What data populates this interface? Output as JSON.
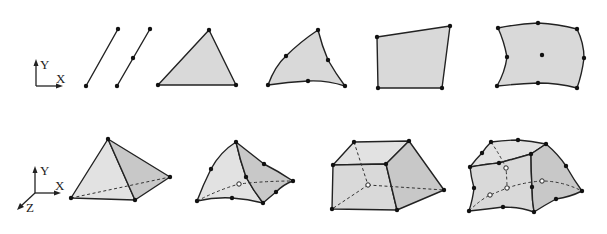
{
  "figure": {
    "row_2d": {
      "axes": {
        "y_label": "Y",
        "x_label": "X"
      },
      "elements": [
        {
          "id": "line-linear",
          "name": "2-node line",
          "nodes": 2
        },
        {
          "id": "line-quadratic",
          "name": "3-node line",
          "nodes": 3
        },
        {
          "id": "tri-linear",
          "name": "3-node triangle",
          "nodes": 3
        },
        {
          "id": "tri-quadratic",
          "name": "6-node triangle",
          "nodes": 6
        },
        {
          "id": "quad-linear",
          "name": "4-node quadrilateral",
          "nodes": 4
        },
        {
          "id": "quad-quadratic",
          "name": "9-node quadrilateral",
          "nodes": 9
        }
      ]
    },
    "row_3d": {
      "axes": {
        "y_label": "Y",
        "x_label": "X",
        "z_label": "Z"
      },
      "elements": [
        {
          "id": "tet-linear",
          "name": "4-node tetrahedron",
          "nodes": 4
        },
        {
          "id": "tet-quadratic",
          "name": "10-node tetrahedron",
          "nodes": 10
        },
        {
          "id": "hex-linear",
          "name": "8-node hexahedron",
          "nodes": 8
        },
        {
          "id": "hex-quadratic",
          "name": "20-node hexahedron",
          "nodes": 20
        }
      ]
    },
    "colors": {
      "background": "#ffffff",
      "stroke": "#222222",
      "face_fill": "#d9d9d9",
      "face_fill_dark": "#c8c8c8",
      "node": "#111111"
    }
  }
}
